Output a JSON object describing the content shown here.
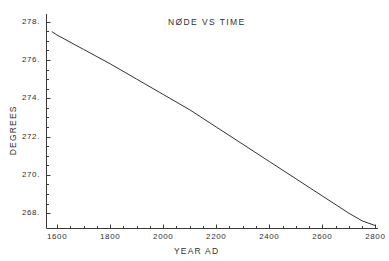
{
  "chart_data": {
    "type": "line",
    "title": "NØDE VS TIME",
    "xlabel": "YEAR  AD",
    "ylabel": "DEGREES",
    "xlim": [
      1560,
      2810
    ],
    "ylim": [
      267.2,
      278.4
    ],
    "grid": false,
    "legend": null,
    "x_ticks": [
      1600,
      1800,
      2000,
      2200,
      2400,
      2600,
      2800
    ],
    "x_tick_labels": [
      "1600",
      "1800",
      "2000",
      "2200",
      "2400",
      "2600",
      "2800"
    ],
    "x_minor_tick_step": 50,
    "y_ticks": [
      268,
      270,
      272,
      274,
      276,
      278
    ],
    "y_tick_labels": [
      "268.",
      "270.",
      "272.",
      "274.",
      "276.",
      "278."
    ],
    "y_minor_tick_step": 0.5,
    "series": [
      {
        "name": "node",
        "color": "#333333",
        "x": [
          1580,
          1600,
          1700,
          1800,
          1900,
          2000,
          2100,
          2150,
          2200,
          2300,
          2400,
          2500,
          2600,
          2700,
          2750,
          2800
        ],
        "y": [
          277.48,
          277.3,
          276.55,
          275.8,
          275.0,
          274.2,
          273.4,
          272.95,
          272.5,
          271.6,
          270.7,
          269.8,
          268.9,
          268.0,
          267.6,
          267.35
        ]
      }
    ]
  },
  "labels": {
    "title": "NØDE VS TIME",
    "xaxis": "YEAR  AD",
    "yaxis": "DEGREES"
  }
}
